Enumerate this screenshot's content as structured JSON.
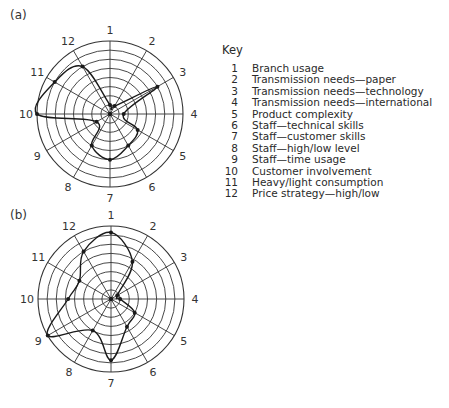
{
  "chart_data": [
    {
      "type": "radar",
      "panel": "(a)",
      "title": "",
      "categories": [
        "1",
        "2",
        "3",
        "4",
        "5",
        "6",
        "7",
        "8",
        "9",
        "10",
        "11",
        "12"
      ],
      "values": [
        1,
        1,
        6,
        1.5,
        3.5,
        4,
        5,
        4,
        1.7,
        8,
        7,
        6
      ],
      "rlim": [
        0,
        8
      ],
      "rings": 8,
      "grid": true,
      "legend": "Key (right side)"
    },
    {
      "type": "radar",
      "panel": "(b)",
      "title": "",
      "categories": [
        "1",
        "2",
        "3",
        "4",
        "5",
        "6",
        "7",
        "8",
        "9",
        "10",
        "11",
        "12"
      ],
      "values": [
        7.3,
        4.7,
        0.8,
        1,
        3,
        3.5,
        6.7,
        4,
        8,
        4.7,
        4,
        6
      ],
      "rlim": [
        0,
        8
      ],
      "rings": 8,
      "grid": true,
      "legend": "Key (right side)"
    }
  ],
  "panels": {
    "a": {
      "label": "(a)",
      "cx": 110,
      "cy": 114,
      "r": 73
    },
    "b": {
      "label": "(b)",
      "cx": 111,
      "cy": 299,
      "r": 73
    }
  },
  "key": {
    "title": "Key",
    "items": [
      {
        "num": "1",
        "label": "Branch usage"
      },
      {
        "num": "2",
        "label": "Transmission needs—paper"
      },
      {
        "num": "3",
        "label": "Transmission needs—technology"
      },
      {
        "num": "4",
        "label": "Transmission needs—international"
      },
      {
        "num": "5",
        "label": "Product complexity"
      },
      {
        "num": "6",
        "label": "Staff—technical skills"
      },
      {
        "num": "7",
        "label": "Staff—customer skills"
      },
      {
        "num": "8",
        "label": "Staff—high/low level"
      },
      {
        "num": "9",
        "label": "Staff—time usage"
      },
      {
        "num": "10",
        "label": "Customer involvement"
      },
      {
        "num": "11",
        "label": "Heavy/light consumption"
      },
      {
        "num": "12",
        "label": "Price strategy—high/low"
      }
    ]
  },
  "colors": {
    "line": "#1a1a1a",
    "grid": "#333333",
    "text": "#333333"
  }
}
